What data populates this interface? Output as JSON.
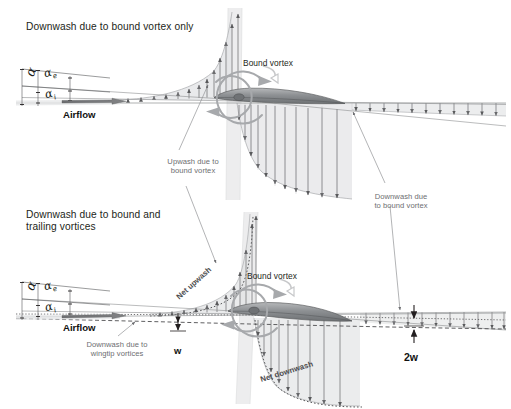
{
  "figure": {
    "type": "technical-diagram",
    "background": "#ffffff",
    "ink": "#231f20",
    "annotation_gray": "#6d6e71",
    "shade_gray": "#d9dadb"
  },
  "panels": [
    {
      "id": "upper",
      "title": "Downwash due to bound vortex only",
      "airflow_label": "Airflow",
      "bound_vortex_label": "Bound vortex",
      "angles": {
        "alpha": "α",
        "alpha_effective": "α",
        "alpha_effective_sub": "e",
        "alpha_induced": "α",
        "alpha_induced_sub": "i"
      }
    },
    {
      "id": "lower",
      "title_line1": "Downwash due to bound and",
      "title_line2": "trailing vortices",
      "airflow_label": "Airflow",
      "bound_vortex_label": "Bound vortex",
      "angles": {
        "alpha": "α",
        "alpha_effective": "α",
        "alpha_effective_sub": "e",
        "alpha_induced": "α",
        "alpha_induced_sub": "i"
      }
    }
  ],
  "annotations": {
    "upwash_bound_line1": "Upwash due to",
    "upwash_bound_line2": "bound vortex",
    "downwash_bound_line1": "Downwash due",
    "downwash_bound_line2": "to bound vortex",
    "downwash_wingtip_line1": "Downwash due to",
    "downwash_wingtip_line2": "wingtip vortices",
    "net_upwash": "Net upwash",
    "net_downwash": "Net downwash",
    "w": "w",
    "two_w": "2w"
  }
}
